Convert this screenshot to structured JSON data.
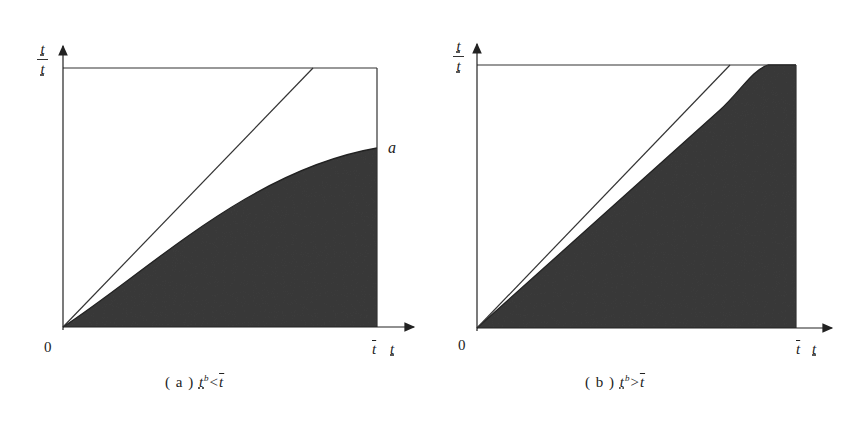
{
  "figure": {
    "panels": [
      {
        "id": "a",
        "caption_prefix": "( a )",
        "caption_lhs": "t",
        "caption_lhs_sup": "b",
        "caption_op": "<",
        "caption_rhs": "t",
        "y_axis_label_top": "t",
        "y_axis_label_bottom": "t",
        "x_tick_label": "t",
        "x_axis_label": "t",
        "origin_label": "0",
        "point_label": "a"
      },
      {
        "id": "b",
        "caption_prefix": "( b )",
        "caption_lhs": "t",
        "caption_lhs_sup": "b",
        "caption_op": ">",
        "caption_rhs": "t",
        "y_axis_label_top": "t",
        "y_axis_label_bottom": "t",
        "x_tick_label": "t",
        "x_axis_label": "t",
        "origin_label": "0"
      }
    ],
    "colors": {
      "fill": "#3a3a3a",
      "line": "#333333",
      "background": "#ffffff"
    }
  }
}
